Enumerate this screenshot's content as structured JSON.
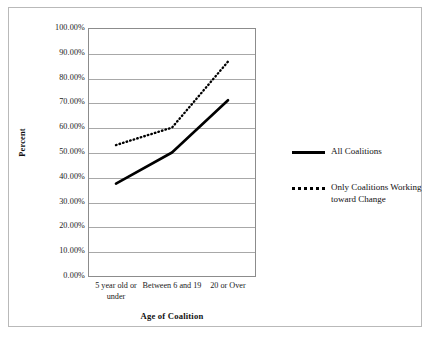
{
  "chart_data": {
    "type": "line",
    "title": "",
    "xlabel": "Age of Coalition",
    "ylabel": "Percent",
    "categories": [
      "5 year old or under",
      "Between 6 and 19",
      "20 or Over"
    ],
    "ylim": [
      0,
      100
    ],
    "ytick_labels": [
      "100.00%",
      "90.00%",
      "80.00%",
      "70.00%",
      "60.00%",
      "50.00%",
      "40.00%",
      "30.00%",
      "20.00%",
      "10.00%",
      "0.00%"
    ],
    "ytick_values": [
      100,
      90,
      80,
      70,
      60,
      50,
      40,
      30,
      20,
      10,
      0
    ],
    "grid": true,
    "legend_position": "right",
    "series": [
      {
        "name": "All Coalitions",
        "style": "solid",
        "color": "#000000",
        "values": [
          37.5,
          50.0,
          71.0
        ]
      },
      {
        "name": "Only Coalitions Working toward Change",
        "style": "dotted",
        "color": "#000000",
        "values": [
          53.0,
          60.0,
          86.5
        ]
      }
    ]
  },
  "axes": {
    "y_title": "Percent",
    "x_title": "Age of Coalition",
    "yticks": [
      {
        "label": "100.00%"
      },
      {
        "label": "90.00%"
      },
      {
        "label": "80.00%"
      },
      {
        "label": "70.00%"
      },
      {
        "label": "60.00%"
      },
      {
        "label": "50.00%"
      },
      {
        "label": "40.00%"
      },
      {
        "label": "30.00%"
      },
      {
        "label": "20.00%"
      },
      {
        "label": "10.00%"
      },
      {
        "label": "0.00%"
      }
    ],
    "xticks": [
      {
        "label": "5 year old or under"
      },
      {
        "label": "Between 6 and 19"
      },
      {
        "label": "20 or Over"
      }
    ]
  },
  "legend": {
    "items": [
      {
        "label": "All Coalitions",
        "style": "solid"
      },
      {
        "label": "Only Coalitions Working toward Change",
        "style": "dotted"
      }
    ]
  },
  "colors": {
    "line": "#000000",
    "grid": "#a8a8a8",
    "frame": "#b9b9b9",
    "plot_border": "#8c8c8c",
    "text": "#111111",
    "background": "#ffffff"
  }
}
